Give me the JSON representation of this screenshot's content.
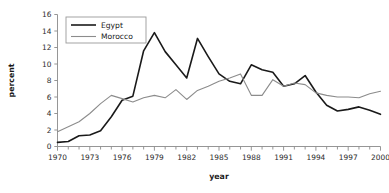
{
  "chart_data": {
    "type": "line",
    "title": "",
    "xlabel": "year",
    "ylabel": "percent",
    "xlim": [
      1970,
      2000
    ],
    "ylim": [
      0,
      16
    ],
    "ytick_step": 2,
    "xtick_step": 1,
    "xtick_label_step": 3,
    "grid": false,
    "legend_position": "top-left",
    "x": [
      1970,
      1971,
      1972,
      1973,
      1974,
      1975,
      1976,
      1977,
      1978,
      1979,
      1980,
      1981,
      1982,
      1983,
      1984,
      1985,
      1986,
      1987,
      1988,
      1989,
      1990,
      1991,
      1992,
      1993,
      1994,
      1995,
      1996,
      1997,
      1998,
      1999,
      2000
    ],
    "xticklabels": [
      "1970",
      "1973",
      "1976",
      "1979",
      "1982",
      "1985",
      "1988",
      "1991",
      "1994",
      "1997",
      "2000"
    ],
    "yticklabels": [
      "0",
      "2",
      "4",
      "6",
      "8",
      "10",
      "12",
      "14",
      "16"
    ],
    "series": [
      {
        "name": "Egypt",
        "color": "#1a1a1a",
        "linewidth": 1.6,
        "values": [
          0.5,
          0.6,
          1.3,
          1.4,
          1.9,
          3.6,
          5.6,
          6.1,
          11.6,
          13.8,
          11.5,
          9.9,
          8.3,
          13.1,
          10.9,
          8.8,
          7.9,
          7.6,
          9.9,
          9.3,
          9.0,
          7.3,
          7.6,
          8.6,
          6.6,
          5.0,
          4.3,
          4.5,
          4.8,
          4.4,
          3.9
        ]
      },
      {
        "name": "Morocco",
        "color": "#8c8c8c",
        "linewidth": 1.1,
        "values": [
          1.8,
          2.4,
          3.0,
          4.0,
          5.2,
          6.2,
          5.8,
          5.4,
          5.9,
          6.2,
          5.9,
          6.9,
          5.7,
          6.8,
          7.3,
          7.9,
          8.3,
          8.8,
          6.2,
          6.2,
          8.1,
          7.3,
          7.7,
          7.5,
          6.5,
          6.2,
          6.0,
          6.0,
          5.9,
          6.4,
          6.7
        ]
      }
    ]
  },
  "legend": {
    "entries": [
      {
        "label": "Egypt"
      },
      {
        "label": "Morocco"
      }
    ]
  },
  "axes": {
    "x_title": "year",
    "y_title": "percent"
  }
}
